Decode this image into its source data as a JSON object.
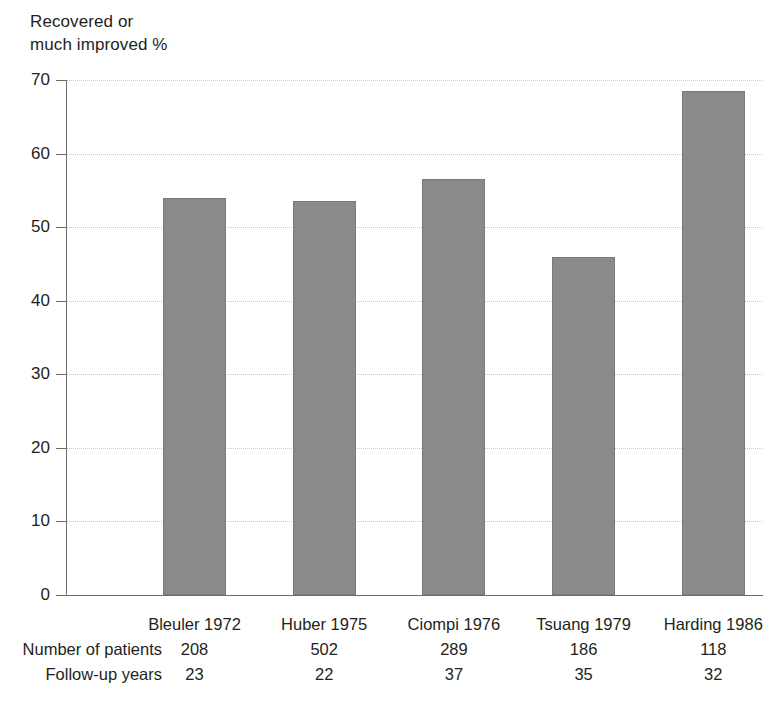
{
  "chart_data": {
    "type": "bar",
    "title": "",
    "ylabel": "Recovered or\nmuch improved %",
    "xlabel": "",
    "ylim": [
      0,
      70
    ],
    "yticks": [
      0,
      10,
      20,
      30,
      40,
      50,
      60,
      70
    ],
    "ytick_labels": [
      "0",
      "10",
      "20",
      "30",
      "40",
      "50",
      "60",
      "70"
    ],
    "grid": true,
    "legend": "none",
    "bar_color": "#8a8a8a",
    "categories": [
      "Bleuler 1972",
      "Huber 1975",
      "Ciompi 1976",
      "Tsuang 1979",
      "Harding 1986"
    ],
    "values": [
      54,
      53.5,
      56.5,
      46,
      68.5
    ],
    "annotations": {
      "row_labels": [
        "Number of patients",
        "Follow-up years"
      ],
      "rows": [
        {
          "label": "Number of patients",
          "values": [
            "208",
            "502",
            "289",
            "186",
            "118"
          ]
        },
        {
          "label": "Follow-up years",
          "values": [
            "23",
            "22",
            "37",
            "35",
            "32"
          ]
        }
      ]
    }
  }
}
